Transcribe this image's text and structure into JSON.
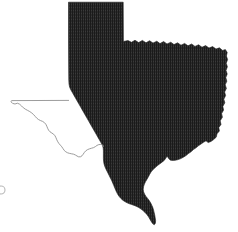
{
  "figure": {
    "name": "texas-state-map",
    "width": 238,
    "height": 232,
    "background_color": "#ffffff"
  },
  "legend": {
    "filled_region_label": "Shaded area",
    "outline_region_label": "Unshaded area"
  },
  "regions": [
    {
      "id": "shaded-region",
      "name": "texas-shaded-region",
      "label": "Shaded eastern and panhandle region",
      "fill_color": "#2b2b2b",
      "fill_pattern": "vertical-hatch",
      "stroke_color": "#1d1d1d",
      "path": "M68.5,2.2 L123.2,2.2 L123.4,41.5 L128,40.6 L131.5,42.3 L135,40.2 L138.6,42.6 L142.4,40.4 L146,42.8 L149.6,40.7 L153,43.1 L156.8,41.2 L160,43.6 L163.6,41.5 L167,44.0 L170.8,42.2 L174,44.6 L177.6,42.8 L181,45.2 L184.6,43.4 L188,45.8 L191.6,44.0 L195,46.4 L198.6,44.8 L202,47.2 L205.6,45.6 L209,48.0 L212.6,46.6 L216,49.0 L219.4,47.8 L222.6,50.4 L225.4,49.6 L227.2,52.4 L226.4,56.0 L227.6,59.6 L226.2,63.2 L227.4,66.8 L226.0,70.4 L227.2,74.0 L225.8,77.6 L226.8,81.2 L225.2,84.8 L226.4,88.4 L224.6,92.0 L225.6,95.6 L223.8,99.2 L224.8,102.8 L222.8,106.4 L223.6,110.0 L221.6,113.6 L222.4,117.2 L220.2,120.8 L221.0,124.4 L218.8,127.6 L219.4,131.0 L217.0,133.8 L216.2,137.2 L213.6,139.6 L211.0,141.4 L208.2,142.6 L206.0,140.8 L203.6,142.2 L201.0,144.0 L198.4,145.8 L196.0,147.8 L193.4,149.6 L191.0,151.8 L188.4,153.6 L186.0,155.6 L183.4,157.2 L180.8,158.6 L178.2,159.6 L175.6,160.2 L173.0,160.4 L170.4,160.2 L168.6,158.4 L167.2,156.0 L165.8,158.2 L164.2,160.4 L162.0,162.2 L159.6,164.0 L157.2,165.8 L155.0,167.8 L152.8,169.8 L151.0,172.0 L149.6,174.4 L148.4,176.8 L147.0,179.2 L145.6,181.6 L144.4,184.0 L143.6,186.6 L143.2,189.2 L143.6,191.8 L144.6,194.2 L146.0,196.4 L147.6,198.4 L149.2,200.6 L150.6,202.8 L151.8,205.2 L152.8,207.6 L153.6,210.2 L154.2,212.8 L154.8,215.4 L155.2,218.0 L155.6,220.6 L155.4,223.2 L154.2,224.8 L152.6,223.6 L151.2,221.4 L149.8,219.0 L148.4,216.6 L146.8,214.4 L145.0,212.4 L143.0,210.6 L141.0,209.0 L138.8,207.6 L136.6,206.4 L134.2,205.4 L131.8,204.6 L129.4,203.8 L127.0,202.8 L124.8,201.6 L122.8,200.2 L121.0,198.6 L119.4,196.8 L118.0,194.8 L116.8,192.6 L115.8,190.4 L114.8,188.0 L113.8,185.6 L112.8,183.2 L111.8,180.8 L110.6,178.4 L109.4,176.0 L108.2,173.6 L107.0,171.2 L105.8,168.8 L104.8,166.4 L104.0,163.8 L103.6,161.2 L103.4,158.6 L103.4,156.0 L103.4,153.4 L103.4,150.8 L103.2,148.2 L102.6,145.6 L101.2,143.0 L99.6,140.2 L98.0,137.4 L96.4,134.6 L94.8,131.8 L93.2,129.0 L91.6,126.2 L90.0,123.4 L88.4,120.6 L86.8,117.8 L85.2,115.0 L83.6,112.2 L82.0,109.4 L80.4,106.6 L78.8,103.8 L77.2,101.0 L75.6,98.2 L74.0,95.4 L72.4,92.6 L70.8,89.8 L69.6,87.0 L69.0,84.0 L68.8,80.0 L68.7,70.0 L68.6,56.0 L68.5,36.0 Z"
    },
    {
      "id": "outline-region",
      "name": "texas-west-outline",
      "label": "Unshaded western region outline, New Mexico border and Rio Grande",
      "stroke_color": "#8a8a8a",
      "path": "M68.6,100.4 L11.6,100.6 L11.0,101.8 L12.6,103.4 L15.0,104.0 L17.4,103.2 L19.6,104.2 L21.6,106.0 L23.4,107.8 L25.4,109.2 L27.6,110.4 L29.8,111.6 L31.8,113.0 L33.6,114.6 L35.2,116.4 L36.8,118.2 L38.6,119.6 L40.6,120.6 L42.6,121.4 L44.4,122.6 L45.8,124.2 L46.8,126.2 L47.6,128.2 L48.6,130.2 L50.0,131.8 L51.8,133.0 L53.6,134.2 L55.0,135.8 L56.0,137.8 L56.8,139.8 L57.8,141.8 L59.0,143.6 L60.4,145.2 L61.8,146.8 L63.0,148.6 L64.2,150.4 L65.8,151.8 L67.6,152.8 L69.6,153.4 L71.6,153.8 L73.6,154.2 L75.4,155.0 L77.0,156.0 L78.6,156.8 L80.4,156.8 L82.0,155.8 L83.2,154.2 L84.4,152.4 L85.8,150.8 L87.6,149.6 L89.6,148.8 L91.6,148.2 L93.6,147.6 L95.4,146.6 L97.0,145.4 L98.8,144.6 L100.8,144.4 L102.8,145.0 L103.4,146.4"
    }
  ],
  "markers": [
    {
      "id": "left-edge-mark",
      "name": "left-edge-artifact",
      "label": "Partial circular mark at left edge",
      "x": 1,
      "y": 190,
      "radius": 4,
      "color": "#b9b9b9"
    }
  ]
}
